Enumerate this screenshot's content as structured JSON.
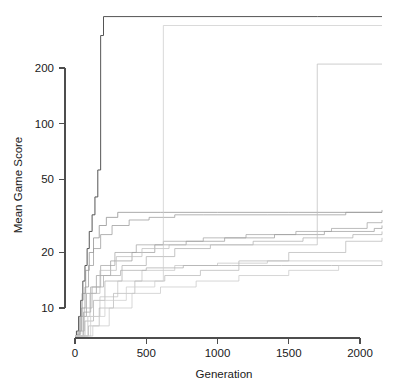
{
  "chart_data": {
    "type": "line",
    "title": "",
    "subtitle": "",
    "xlabel": "Generation",
    "ylabel": "Mean Game Score",
    "xlim": [
      0,
      2200
    ],
    "ylim": [
      6,
      400
    ],
    "yscale": "log",
    "xscale": "linear",
    "grid": false,
    "legend": false,
    "legend_position": "none",
    "step_style": "hv",
    "xticks": [
      0,
      500,
      1000,
      1500,
      2000
    ],
    "xticklabels": [
      "0",
      "500",
      "1000",
      "1500",
      "2000"
    ],
    "yticks": [
      10,
      20,
      50,
      100,
      200
    ],
    "yticklabels": [
      "10",
      "20",
      "50",
      "100",
      "200"
    ],
    "annotations": [],
    "series": [
      {
        "name": "run-01",
        "color": "#555555",
        "x": [
          0,
          10,
          25,
          40,
          55,
          70,
          85,
          100,
          120,
          140,
          160,
          180,
          200,
          1700,
          2200
        ],
        "y": [
          6,
          7.5,
          9,
          11,
          14,
          17,
          21,
          26,
          32,
          40,
          56,
          300,
          380,
          380,
          380
        ]
      },
      {
        "name": "run-02",
        "color": "#8c8c8c",
        "x": [
          0,
          15,
          30,
          50,
          75,
          100,
          130,
          170,
          220,
          300,
          400,
          600,
          1000,
          1500,
          2200
        ],
        "y": [
          6,
          7,
          9,
          12,
          16,
          20,
          24,
          28,
          31,
          33,
          33,
          33,
          33,
          33,
          33
        ]
      },
      {
        "name": "run-03",
        "color": "#999999",
        "x": [
          0,
          20,
          45,
          70,
          95,
          130,
          180,
          260,
          380,
          520,
          700,
          900,
          1350,
          1600,
          1900,
          2200
        ],
        "y": [
          6,
          7.5,
          10,
          13,
          17,
          21,
          25,
          28,
          30,
          31,
          32,
          32,
          32,
          32,
          33,
          34
        ]
      },
      {
        "name": "run-04",
        "color": "#a6a6a6",
        "x": [
          0,
          25,
          60,
          110,
          180,
          280,
          430,
          620,
          900,
          1200,
          1550,
          1800,
          2050,
          2200
        ],
        "y": [
          6,
          7,
          9.5,
          13,
          17,
          20,
          22,
          23,
          24,
          25,
          26,
          27,
          29,
          30
        ]
      },
      {
        "name": "run-05",
        "color": "#b0b0b0",
        "x": [
          0,
          30,
          70,
          130,
          210,
          330,
          500,
          700,
          950,
          1250,
          1600,
          1950,
          2200
        ],
        "y": [
          6,
          6.8,
          8.5,
          11,
          14,
          17,
          19,
          21,
          22,
          23,
          24,
          25,
          26
        ]
      },
      {
        "name": "run-06",
        "color": "#9e9e9e",
        "x": [
          0,
          18,
          40,
          80,
          150,
          250,
          400,
          560,
          780,
          1050,
          1400,
          1750,
          2100,
          2200
        ],
        "y": [
          6,
          7.2,
          9,
          12,
          15,
          18,
          20,
          22,
          23,
          24,
          25,
          26,
          27,
          28
        ]
      },
      {
        "name": "run-07",
        "color": "#bdbdbd",
        "x": [
          0,
          22,
          55,
          105,
          175,
          290,
          470,
          660,
          1600,
          1700,
          2200
        ],
        "y": [
          6,
          7,
          9,
          12,
          16,
          19,
          21,
          22,
          22,
          210,
          210
        ]
      },
      {
        "name": "run-08",
        "color": "#c4c4c4",
        "x": [
          0,
          35,
          90,
          175,
          300,
          470,
          700,
          1000,
          1350,
          1700,
          2050,
          2200
        ],
        "y": [
          6,
          7,
          9,
          11.5,
          14,
          16,
          17,
          17.5,
          18,
          18,
          18,
          18
        ]
      },
      {
        "name": "run-09",
        "color": "#aeaeae",
        "x": [
          0,
          28,
          65,
          120,
          200,
          320,
          500,
          760,
          1100,
          1450,
          1800,
          2200
        ],
        "y": [
          6,
          7.5,
          10,
          13,
          15,
          16,
          16.5,
          17,
          17,
          17,
          17,
          17
        ]
      },
      {
        "name": "run-10",
        "color": "#b8b8b8",
        "x": [
          0,
          40,
          95,
          170,
          270,
          420,
          630,
          880,
          1150,
          1500,
          1900,
          2200
        ],
        "y": [
          6,
          6.6,
          8,
          10,
          12,
          14,
          15,
          16,
          18,
          20,
          23,
          24
        ]
      },
      {
        "name": "run-11",
        "color": "#cccccc",
        "x": [
          0,
          45,
          110,
          210,
          360,
          560,
          620,
          2200
        ],
        "y": [
          6,
          7,
          9,
          11,
          13,
          14,
          340,
          340
        ]
      },
      {
        "name": "run-12",
        "color": "#c9c9c9",
        "x": [
          0,
          50,
          125,
          240,
          400,
          600,
          850,
          1150,
          1500,
          1850,
          2200
        ],
        "y": [
          6,
          6.5,
          8,
          10,
          12,
          13,
          14,
          15,
          16,
          17,
          18
        ]
      }
    ]
  },
  "axes": {
    "y_axis_name": "y-axis",
    "x_axis_name": "x-axis"
  }
}
